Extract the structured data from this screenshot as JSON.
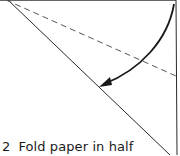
{
  "diagram": {
    "step_number": "2",
    "instruction": "Fold paper in half",
    "line_color": "#2a2a2a",
    "dashed_color": "#555555",
    "arrow_color": "#1a1a1a",
    "elements": [
      "diagonal-fold-edge",
      "valley-fold-dashed-line",
      "fold-direction-arrow",
      "right-edge",
      "top-edge"
    ]
  }
}
